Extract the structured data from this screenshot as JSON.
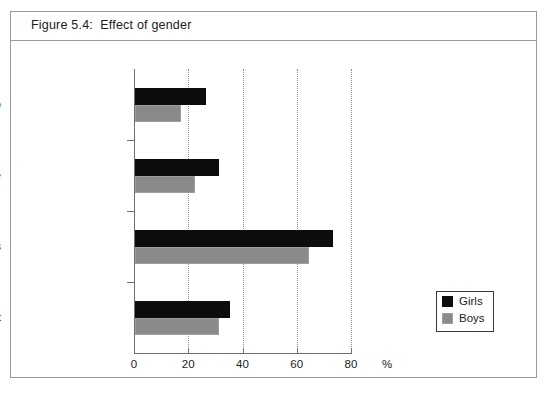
{
  "figure": {
    "title": "Figure 5.4:  Effect of gender",
    "bleed_text": ""
  },
  "legend": {
    "position": "inside-bottom-right",
    "items": [
      {
        "label": "Girls",
        "color": "#0d0d0d"
      },
      {
        "label": "Boys",
        "color": "#8a8a8a"
      }
    ]
  },
  "axis": {
    "x_unit": "%",
    "x_ticks": [
      "0",
      "20",
      "40",
      "60",
      "80"
    ]
  },
  "chart_data": {
    "type": "bar",
    "orientation": "horizontal",
    "title": "Figure 5.4:  Effect of gender",
    "xlabel": "%",
    "ylabel": "",
    "xlim": [
      0,
      80
    ],
    "xticks": [
      0,
      20,
      40,
      60,
      80
    ],
    "grid": "vertical-dotted",
    "legend_position": "inside-bottom-right",
    "categories": [
      "Wash up",
      "Tidy house",
      "Worry about others",
      "Look after ill adult"
    ],
    "series": [
      {
        "name": "Girls",
        "color": "#0d0d0d",
        "values": [
          26,
          31,
          73,
          35
        ]
      },
      {
        "name": "Boys",
        "color": "#8a8a8a",
        "values": [
          17,
          22,
          64,
          31
        ]
      }
    ]
  }
}
